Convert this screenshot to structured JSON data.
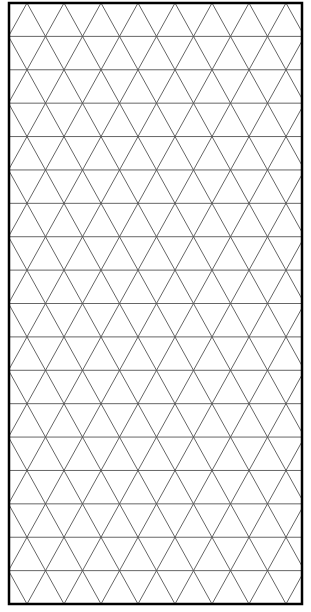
{
  "diagram": {
    "type": "isometric-triangle-grid",
    "frame": {
      "x": 9,
      "y": 3,
      "width": 293,
      "height": 601,
      "stroke": "#000000",
      "stroke_width": 2.5
    },
    "grid": {
      "rows": 18,
      "row_height": 33.39,
      "col_width": 37,
      "x_offset": 27,
      "line_color": "#555555",
      "line_width": 0.9
    },
    "background": "#ffffff"
  }
}
